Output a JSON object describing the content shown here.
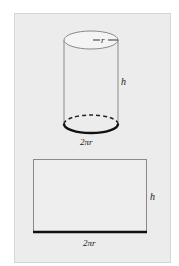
{
  "figure": {
    "cylinder": {
      "radius_label": "r",
      "height_label": "h",
      "circumference_label": "2πr"
    },
    "rectangle": {
      "height_label": "h",
      "width_label": "2πr"
    },
    "colors": {
      "panel_bg": "#ececec",
      "panel_border": "#d6d6d6",
      "line": "#777777",
      "thick_line": "#111111"
    }
  }
}
